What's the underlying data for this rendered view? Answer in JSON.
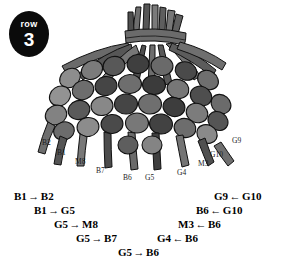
{
  "badge": {
    "word": "row",
    "number": "3",
    "color": "#0b0b0b"
  },
  "artwork": {
    "name": "beaded-tassel-diagram",
    "palette": {
      "outline": "#111111",
      "bead_dark": "#3a3a3a",
      "bead_mid": "#6e6e6e",
      "bead_light": "#909090",
      "cord": "#5a5a5a",
      "background": "#ffffff"
    }
  },
  "bead_labels": [
    {
      "text": "B2",
      "x": 42,
      "y": 142
    },
    {
      "text": "B1",
      "x": 57,
      "y": 152
    },
    {
      "text": "M8",
      "x": 75,
      "y": 161
    },
    {
      "text": "B7",
      "x": 96,
      "y": 170
    },
    {
      "text": "B6",
      "x": 123,
      "y": 177
    },
    {
      "text": "G5",
      "x": 145,
      "y": 177
    },
    {
      "text": "G4",
      "x": 177,
      "y": 172
    },
    {
      "text": "M3",
      "x": 198,
      "y": 163
    },
    {
      "text": "G10",
      "x": 212,
      "y": 154
    },
    {
      "text": "G9",
      "x": 232,
      "y": 140
    }
  ],
  "instructions": {
    "left_column": [
      {
        "from": "B1",
        "arrow": "→",
        "to": "B2",
        "x": 14,
        "y": 2
      },
      {
        "from": "B1",
        "arrow": "→",
        "to": "G5",
        "x": 34,
        "y": 16
      },
      {
        "from": "G5",
        "arrow": "→",
        "to": "M8",
        "x": 54,
        "y": 30
      },
      {
        "from": "G5",
        "arrow": "→",
        "to": "B7",
        "x": 76,
        "y": 44
      },
      {
        "from": "G5",
        "arrow": "→",
        "to": "B6",
        "x": 118,
        "y": 58
      }
    ],
    "right_column": [
      {
        "from": "G9",
        "arrow": "←",
        "to": "G10",
        "x": 214,
        "y": 2
      },
      {
        "from": "B6",
        "arrow": "←",
        "to": "G10",
        "x": 196,
        "y": 16
      },
      {
        "from": "M3",
        "arrow": "←",
        "to": "B6",
        "x": 178,
        "y": 30
      },
      {
        "from": "G4",
        "arrow": "←",
        "to": "B6",
        "x": 157,
        "y": 44
      }
    ]
  }
}
